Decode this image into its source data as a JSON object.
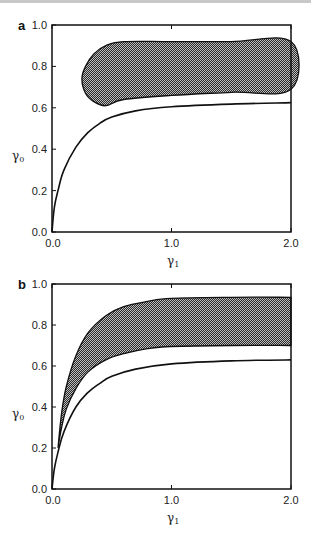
{
  "chart_data": [
    {
      "type": "area",
      "panel": "a",
      "title": "",
      "xlabel": "γ1",
      "ylabel": "γ0",
      "xlim": [
        0.0,
        2.0
      ],
      "ylim": [
        0.0,
        1.0
      ],
      "xticks": [
        "0.0",
        "1.0",
        "2.0"
      ],
      "yticks": [
        "0.0",
        "0.2",
        "0.4",
        "0.6",
        "0.8",
        "1.0"
      ],
      "grid": false,
      "series": [
        {
          "name": "shaded region (closed)",
          "kind": "filled-region",
          "x": [
            0.25,
            0.28,
            0.35,
            0.45,
            0.6,
            1.0,
            1.5,
            2.0,
            2.0,
            1.5,
            1.0,
            0.6,
            0.45,
            0.35,
            0.28,
            0.25
          ],
          "y": [
            0.74,
            0.8,
            0.86,
            0.9,
            0.92,
            0.92,
            0.92,
            0.92,
            0.69,
            0.675,
            0.66,
            0.64,
            0.61,
            0.63,
            0.67,
            0.74
          ]
        },
        {
          "name": "lower curve",
          "kind": "line",
          "x": [
            0.0,
            0.02,
            0.05,
            0.1,
            0.2,
            0.3,
            0.4,
            0.5,
            0.7,
            1.0,
            1.5,
            2.0
          ],
          "y": [
            0.0,
            0.12,
            0.2,
            0.3,
            0.41,
            0.48,
            0.525,
            0.555,
            0.585,
            0.605,
            0.618,
            0.625
          ]
        }
      ]
    },
    {
      "type": "area",
      "panel": "b",
      "title": "",
      "xlabel": "γ1",
      "ylabel": "γ0",
      "xlim": [
        0.0,
        2.0
      ],
      "ylim": [
        0.0,
        1.0
      ],
      "xticks": [
        "0.0",
        "1.0",
        "2.0"
      ],
      "yticks": [
        "0.0",
        "0.2",
        "0.4",
        "0.6",
        "0.8",
        "1.0"
      ],
      "grid": false,
      "series": [
        {
          "name": "shaded band upper boundary",
          "kind": "filled-region-upper",
          "x": [
            0.05,
            0.08,
            0.12,
            0.2,
            0.3,
            0.45,
            0.6,
            0.8,
            1.0,
            1.5,
            2.0
          ],
          "y": [
            0.2,
            0.37,
            0.5,
            0.65,
            0.76,
            0.845,
            0.89,
            0.915,
            0.93,
            0.935,
            0.935
          ]
        },
        {
          "name": "shaded band lower boundary",
          "kind": "filled-region-lower",
          "x": [
            0.05,
            0.08,
            0.12,
            0.2,
            0.3,
            0.45,
            0.6,
            0.8,
            1.0,
            1.5,
            2.0
          ],
          "y": [
            0.2,
            0.3,
            0.39,
            0.49,
            0.57,
            0.63,
            0.66,
            0.685,
            0.695,
            0.7,
            0.7
          ]
        },
        {
          "name": "lower curve",
          "kind": "line",
          "x": [
            0.0,
            0.02,
            0.05,
            0.1,
            0.2,
            0.3,
            0.4,
            0.5,
            0.7,
            1.0,
            1.5,
            2.0
          ],
          "y": [
            0.0,
            0.1,
            0.18,
            0.28,
            0.4,
            0.47,
            0.515,
            0.55,
            0.585,
            0.61,
            0.625,
            0.63
          ]
        }
      ]
    }
  ],
  "panels": {
    "a": {
      "label": "a",
      "xlabel_main": "γ",
      "xlabel_sub": "1",
      "ylabel_main": "γ",
      "ylabel_sub": "0"
    },
    "b": {
      "label": "b",
      "xlabel_main": "γ",
      "xlabel_sub": "1",
      "ylabel_main": "γ",
      "ylabel_sub": "0"
    }
  },
  "ticks": {
    "y": [
      "0.0",
      "0.2",
      "0.4",
      "0.6",
      "0.8",
      "1.0"
    ],
    "x": [
      "0.0",
      "1.0",
      "2.0"
    ]
  }
}
